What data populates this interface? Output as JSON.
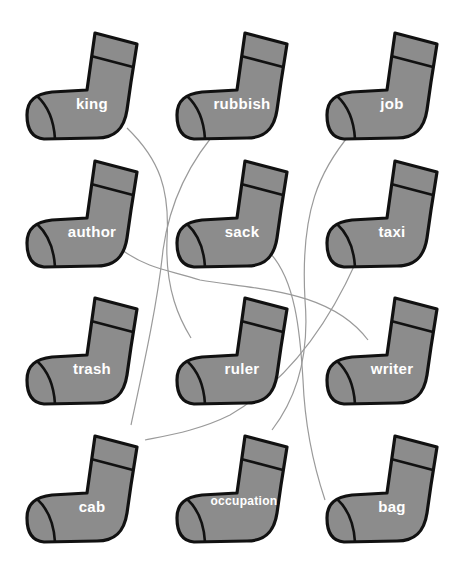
{
  "colors": {
    "sock_fill": "#8c8c8c",
    "outline": "#111111",
    "label": "#ffffff",
    "line": "#9a9a9a"
  },
  "socks": [
    {
      "word": "king",
      "x": 22,
      "y": 30
    },
    {
      "word": "rubbish",
      "x": 172,
      "y": 30
    },
    {
      "word": "job",
      "x": 322,
      "y": 30
    },
    {
      "word": "author",
      "x": 22,
      "y": 158
    },
    {
      "word": "sack",
      "x": 172,
      "y": 158
    },
    {
      "word": "taxi",
      "x": 322,
      "y": 158
    },
    {
      "word": "trash",
      "x": 22,
      "y": 295
    },
    {
      "word": "ruler",
      "x": 172,
      "y": 295
    },
    {
      "word": "writer",
      "x": 322,
      "y": 295
    },
    {
      "word": "cab",
      "x": 22,
      "y": 433
    },
    {
      "word": "occupation",
      "x": 172,
      "y": 433
    },
    {
      "word": "bag",
      "x": 322,
      "y": 433
    }
  ],
  "connections": [
    {
      "from": "king",
      "to": "ruler",
      "path": "M127,128 C160,160 170,190 167,240 C165,290 180,320 191,338"
    },
    {
      "from": "rubbish",
      "to": "trash",
      "path": "M222,125 C190,160 170,200 163,250 C158,300 145,360 131,425"
    },
    {
      "from": "job",
      "to": "occupation",
      "path": "M351,133 C320,170 300,210 305,300 C310,360 295,400 272,430"
    },
    {
      "from": "author",
      "to": "writer",
      "path": "M122,250 C150,270 170,270 200,280 C260,290 330,290 368,340"
    },
    {
      "from": "sack",
      "to": "bag",
      "path": "M270,253 C295,280 300,330 303,380 C305,430 315,470 325,500"
    },
    {
      "from": "taxi",
      "to": "cab",
      "path": "M356,262 C330,320 290,380 230,415 C200,430 170,435 145,440"
    }
  ]
}
